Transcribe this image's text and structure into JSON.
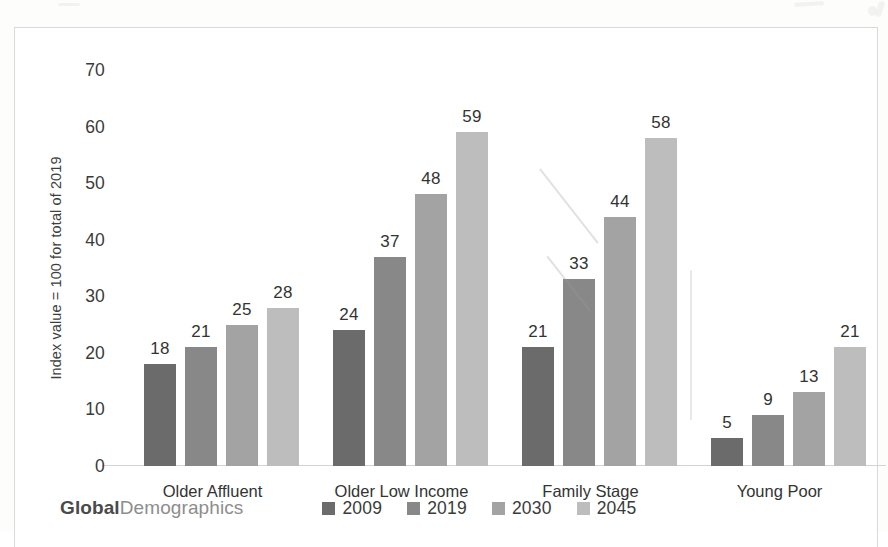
{
  "chart_data": {
    "type": "bar",
    "title": "",
    "subtitle": "",
    "xlabel": "",
    "ylabel": "Index value = 100 for total of 2019",
    "ylim": [
      0,
      70
    ],
    "yticks": [
      70,
      60,
      50,
      40,
      30,
      20,
      10,
      0
    ],
    "grid": false,
    "legend_position": "bottom",
    "categories": [
      "Older Affluent",
      "Older Low Income",
      "Family Stage",
      "Young Poor"
    ],
    "series": [
      {
        "name": "2009",
        "color": "#6b6b6b",
        "values": [
          18,
          24,
          21,
          5
        ]
      },
      {
        "name": "2019",
        "color": "#888888",
        "values": [
          21,
          37,
          33,
          9
        ]
      },
      {
        "name": "2030",
        "color": "#a3a3a3",
        "values": [
          25,
          48,
          44,
          13
        ]
      },
      {
        "name": "2045",
        "color": "#bdbdbd",
        "values": [
          28,
          59,
          58,
          21
        ]
      }
    ]
  },
  "footer": {
    "brand_bold": "Global",
    "brand_light": "Demographics"
  }
}
